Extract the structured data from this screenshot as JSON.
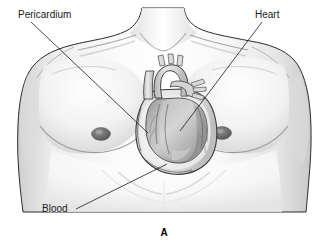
{
  "figure": {
    "caption": "A",
    "background_color": "#ffffff",
    "line_color": "#1c1c1c",
    "text_color": "#1a1a1a"
  },
  "labels": [
    {
      "id": "pericardium",
      "text": "Pericardium",
      "text_x": 18,
      "text_y": 18,
      "anchor": "start",
      "leader": "M 31 22 L 148 133"
    },
    {
      "id": "heart",
      "text": "Heart",
      "text_x": 255,
      "text_y": 18,
      "anchor": "start",
      "leader": "M 262 22 L 180 131"
    },
    {
      "id": "blood",
      "text": "Blood",
      "text_x": 42,
      "text_y": 212,
      "anchor": "start",
      "leader": "M 76 209 L 167 164"
    }
  ],
  "anatomy": {
    "torso": {
      "name": "male-chest-torso",
      "fill": "#f4f4f4",
      "outline": "#2b2b2b"
    },
    "nipples": [
      {
        "side": "left",
        "cx": 101,
        "cy": 134,
        "rx": 9,
        "ry": 6
      },
      {
        "side": "right",
        "cx": 222,
        "cy": 133,
        "rx": 9,
        "ry": 6
      }
    ],
    "heart": {
      "name": "heart-in-pericardial-sac",
      "pericardium_fill": "#e2e2e2",
      "myocardium_fill": "#b9b9b9",
      "vessel_fill": "#d8d8d8"
    }
  }
}
